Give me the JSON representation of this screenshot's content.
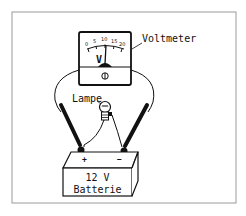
{
  "diagram": {
    "type": "circuit-illustration",
    "labels": {
      "voltmeter": "Voltmeter",
      "lamp": "Lampe",
      "battery_voltage": "12 V",
      "battery_name": "Batterie",
      "unit": "V",
      "plus_terminal": "+",
      "minus_terminal": "−"
    },
    "voltmeter_scale": {
      "ticks": [
        "0",
        "5",
        "10",
        "15",
        "20"
      ]
    },
    "colors": {
      "ink": "#111111",
      "frame": "#9a9a9a",
      "background": "#ffffff"
    }
  }
}
